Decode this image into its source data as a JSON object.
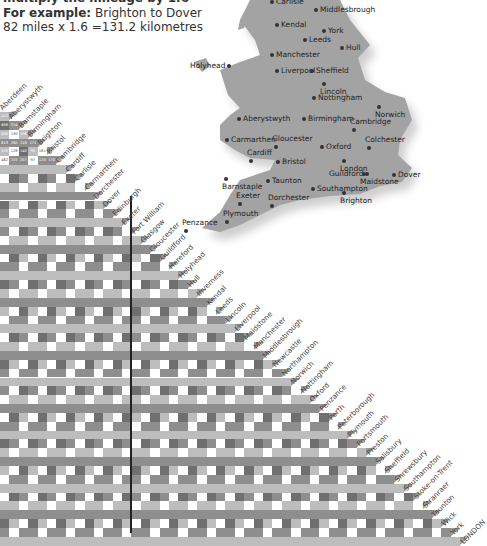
{
  "header": {
    "cut_line": "multiply the mileage by 1.6",
    "example_label": "For example:",
    "example_text": " Brighton to Dover",
    "calculation": "82 miles x 1.6 =131.2 kilometres"
  },
  "map": {
    "land_color": "#a3a3a3",
    "shadow_color": "#cfcfcf",
    "towns": [
      {
        "name": "Carlisle",
        "x": 88,
        "y": -2,
        "side": "right"
      },
      {
        "name": "Middlesbrough",
        "x": 132,
        "y": 6,
        "side": "right"
      },
      {
        "name": "Kendal",
        "x": 93,
        "y": 21,
        "side": "right"
      },
      {
        "name": "York",
        "x": 140,
        "y": 27,
        "side": "right"
      },
      {
        "name": "Leeds",
        "x": 121,
        "y": 36,
        "side": "right"
      },
      {
        "name": "Hull",
        "x": 158,
        "y": 44,
        "side": "right"
      },
      {
        "name": "Manchester",
        "x": 88,
        "y": 51,
        "side": "right"
      },
      {
        "name": "Holyhead",
        "x": 12,
        "y": 62,
        "side": "left"
      },
      {
        "name": "Liverpool",
        "x": 93,
        "y": 67,
        "side": "right"
      },
      {
        "name": "Sheffield",
        "x": 128,
        "y": 67,
        "side": "right"
      },
      {
        "name": "Lincoln",
        "x": 150,
        "y": 80,
        "side": "below"
      },
      {
        "name": "Nottingham",
        "x": 130,
        "y": 94,
        "side": "right"
      },
      {
        "name": "Norwich",
        "x": 205,
        "y": 103,
        "side": "below"
      },
      {
        "name": "Aberystwyth",
        "x": 55,
        "y": 115,
        "side": "right"
      },
      {
        "name": "Birmingham",
        "x": 120,
        "y": 115,
        "side": "right"
      },
      {
        "name": "Cambridge",
        "x": 180,
        "y": 118,
        "side": "above"
      },
      {
        "name": "Carmarthen",
        "x": 43,
        "y": 136,
        "side": "right"
      },
      {
        "name": "Gloucester",
        "x": 102,
        "y": 135,
        "side": "above"
      },
      {
        "name": "Colchester",
        "x": 195,
        "y": 136,
        "side": "above"
      },
      {
        "name": "Oxford",
        "x": 138,
        "y": 143,
        "side": "right"
      },
      {
        "name": "Cardiff",
        "x": 77,
        "y": 149,
        "side": "above"
      },
      {
        "name": "Bristol",
        "x": 94,
        "y": 158,
        "side": "right"
      },
      {
        "name": "London",
        "x": 170,
        "y": 157,
        "side": "below"
      },
      {
        "name": "Guildford",
        "x": 151,
        "y": 170,
        "side": "left"
      },
      {
        "name": "Maidstone",
        "x": 190,
        "y": 170,
        "side": "below"
      },
      {
        "name": "Dover",
        "x": 210,
        "y": 171,
        "side": "right"
      },
      {
        "name": "Barnstaple",
        "x": 52,
        "y": 175,
        "side": "below"
      },
      {
        "name": "Taunton",
        "x": 84,
        "y": 177,
        "side": "right"
      },
      {
        "name": "Southampton",
        "x": 129,
        "y": 185,
        "side": "right"
      },
      {
        "name": "Brighton",
        "x": 170,
        "y": 189,
        "side": "below"
      },
      {
        "name": "Exeter",
        "x": 66,
        "y": 192,
        "side": "above"
      },
      {
        "name": "Dorchester",
        "x": 98,
        "y": 194,
        "side": "above"
      },
      {
        "name": "Plymouth",
        "x": 53,
        "y": 210,
        "side": "above"
      },
      {
        "name": "Penzance",
        "x": 12,
        "y": 219,
        "side": "above"
      }
    ]
  },
  "mileage_table": {
    "title_rotation_deg": -45,
    "cities": [
      "Aberdeen",
      "Aberystwyth",
      "Barnstaple",
      "Birmingham",
      "Brighton",
      "Bristol",
      "Cambridge",
      "Cardiff",
      "Carlisle",
      "Carmarthen",
      "Dorchester",
      "Dover",
      "Edinburgh",
      "Exeter",
      "Fort William",
      "Glasgow",
      "Gloucester",
      "Guildford",
      "Hereford",
      "Holyhead",
      "Hull",
      "Inverness",
      "Kendal",
      "Leeds",
      "Lincoln",
      "Liverpool",
      "Maidstone",
      "Manchester",
      "Middlesbrough",
      "Newcastle",
      "Northampton",
      "Norwich",
      "Nottingham",
      "Oxford",
      "Penzance",
      "Perth",
      "Peterborough",
      "Plymouth",
      "Portsmouth",
      "Preston",
      "Salisbury",
      "Sheffield",
      "Shrewsbury",
      "Southampton",
      "Stoke-on-Trent",
      "Stranraer",
      "Taunton",
      "Wick",
      "York",
      "LONDON"
    ],
    "readable_rows": [
      {
        "city": "Aberystwyth",
        "values": [
          "412"
        ]
      },
      {
        "city": "Barnstaple",
        "values": [
          "608",
          "214"
        ]
      },
      {
        "city": "Birmingham",
        "values": [
          "436",
          "130",
          "196"
        ]
      },
      {
        "city": "Brighton",
        "values": [
          "613",
          "260",
          "218",
          "171"
        ]
      },
      {
        "city": "Bristol",
        "values": [
          "519",
          "128",
          "140",
          "90",
          "161"
        ]
      },
      {
        "city": "Cambridge",
        "values": [
          "462",
          "215",
          "257",
          "97",
          "120",
          "170"
        ]
      }
    ],
    "example_pair": {
      "from": "Brighton",
      "to": "Dover",
      "miles": "82"
    },
    "shade_colors": {
      "light": "#bdbdbd",
      "mid": "#8e8e8e",
      "white": "#ffffff",
      "dark": "#6f6f6f"
    }
  }
}
